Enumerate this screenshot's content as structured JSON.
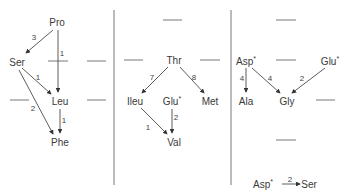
{
  "panels": [
    {
      "nodes": [
        {
          "id": "pro",
          "label": "Pro",
          "x": 57,
          "y": 22
        },
        {
          "id": "ser",
          "label": "Ser",
          "x": 17,
          "y": 62
        },
        {
          "id": "leu",
          "label": "Leu",
          "x": 60,
          "y": 101
        },
        {
          "id": "phe",
          "label": "Phe",
          "x": 60,
          "y": 142
        }
      ],
      "edges": [
        {
          "from": "pro",
          "to": "ser",
          "label": "3"
        },
        {
          "from": "pro",
          "to": "leu",
          "label": "1"
        },
        {
          "from": "ser",
          "to": "leu",
          "label": "1"
        },
        {
          "from": "ser",
          "to": "phe",
          "label": "2"
        },
        {
          "from": "leu",
          "to": "phe",
          "label": "1"
        }
      ]
    },
    {
      "nodes": [
        {
          "id": "thr",
          "label": "Thr",
          "x": 174,
          "y": 60
        },
        {
          "id": "ileu",
          "label": "Ileu",
          "x": 135,
          "y": 101
        },
        {
          "id": "glu1",
          "label": "Glu",
          "star": "*",
          "x": 172,
          "y": 101
        },
        {
          "id": "met",
          "label": "Met",
          "x": 210,
          "y": 101
        },
        {
          "id": "val",
          "label": "Val",
          "x": 174,
          "y": 142
        }
      ],
      "edges": [
        {
          "from": "thr",
          "to": "ileu",
          "label": "7"
        },
        {
          "from": "thr",
          "to": "met",
          "label": "8"
        },
        {
          "from": "ileu",
          "to": "val",
          "label": "1"
        },
        {
          "from": "glu1",
          "to": "val",
          "label": "2"
        }
      ]
    },
    {
      "nodes": [
        {
          "id": "asp",
          "label": "Asp",
          "star": "*",
          "x": 246,
          "y": 61
        },
        {
          "id": "glu2",
          "label": "Glu",
          "star": "*",
          "x": 330,
          "y": 61
        },
        {
          "id": "ala",
          "label": "Ala",
          "x": 246,
          "y": 101
        },
        {
          "id": "gly",
          "label": "Gly",
          "x": 287,
          "y": 101
        },
        {
          "id": "asp2",
          "label": "Asp",
          "star": "*",
          "x": 263,
          "y": 184
        },
        {
          "id": "ser2",
          "label": "Ser",
          "x": 309,
          "y": 184
        }
      ],
      "edges": [
        {
          "from": "asp",
          "to": "ala",
          "label": "4"
        },
        {
          "from": "asp",
          "to": "gly",
          "label": "4"
        },
        {
          "from": "glu2",
          "to": "gly",
          "label": "2"
        },
        {
          "from": "asp2",
          "to": "ser2",
          "label": "2"
        }
      ]
    }
  ]
}
